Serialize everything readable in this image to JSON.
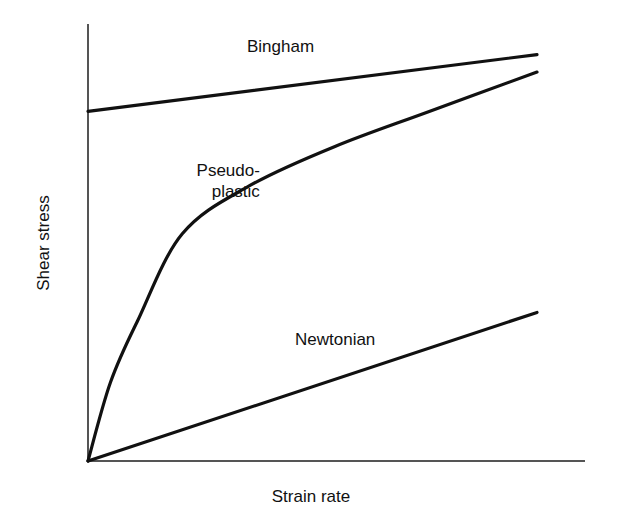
{
  "figure": {
    "background_color": "#ffffff",
    "line_color": "#111111",
    "axis_color": "#555555",
    "width": 621,
    "height": 521
  },
  "axes": {
    "y_title": "Shear stress",
    "x_title": "Strain rate",
    "origin_px": [
      88,
      461
    ],
    "y_axis_top_px": [
      88,
      24
    ],
    "x_axis_right_px": [
      585,
      461
    ]
  },
  "labels": {
    "bingham": "Bingham",
    "pseudoplastic_line1": "Pseudo-",
    "pseudoplastic_line2": "plastic",
    "newtonian": "Newtonian"
  },
  "chart_data": {
    "type": "line",
    "title": "",
    "xlabel": "Strain rate",
    "ylabel": "Shear stress",
    "xlim": [
      0,
      1
    ],
    "ylim": [
      0,
      1
    ],
    "grid": false,
    "legend": "inline-annotations",
    "axis_ticks": {
      "x": [],
      "y": []
    },
    "note": "Schematic rheogram: shear stress versus strain rate for three fluid types. Values are normalized 0-1 (dimensionless schematic, no numeric tick labels shown).",
    "series": [
      {
        "name": "Bingham",
        "kind": "line",
        "description": "Straight line with positive yield stress intercept; nearly flat slope.",
        "x": [
          0.0,
          0.25,
          0.5,
          0.75,
          1.0
        ],
        "y": [
          0.8,
          0.83,
          0.86,
          0.9,
          0.93
        ],
        "label_position": [
          0.355,
          0.94
        ]
      },
      {
        "name": "Pseudo-plastic",
        "kind": "curve",
        "description": "Shear-thinning curve rising steeply from the origin then flattening.",
        "x": [
          0.0,
          0.05,
          0.11,
          0.21,
          0.36,
          0.55,
          0.76,
          1.0
        ],
        "y": [
          0.0,
          0.18,
          0.32,
          0.52,
          0.63,
          0.72,
          0.8,
          0.89
        ],
        "label_position": [
          0.12,
          0.64
        ]
      },
      {
        "name": "Newtonian",
        "kind": "line",
        "description": "Straight line through the origin with constant viscosity.",
        "x": [
          0.0,
          0.25,
          0.5,
          0.75,
          1.0
        ],
        "y": [
          0.0,
          0.085,
          0.17,
          0.255,
          0.34
        ],
        "label_position": [
          0.46,
          0.27
        ]
      }
    ]
  }
}
